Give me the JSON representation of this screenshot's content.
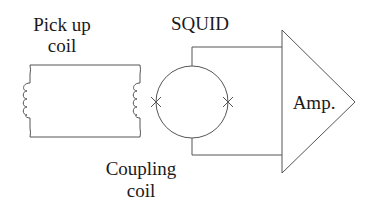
{
  "diagram": {
    "labels": {
      "pickup_line1": "Pick up",
      "pickup_line2": "coil",
      "squid": "SQUID",
      "coupling_line1": "Coupling",
      "coupling_line2": "coil",
      "amp": "Amp."
    },
    "components": [
      {
        "id": "pickup-coil",
        "type": "inductor-loop",
        "label": "Pick up coil"
      },
      {
        "id": "coupling-coil",
        "type": "inductor",
        "label": "Coupling coil"
      },
      {
        "id": "squid-ring",
        "type": "superconducting-loop",
        "label": "SQUID",
        "junctions": 2
      },
      {
        "id": "amplifier",
        "type": "triangle-amplifier",
        "label": "Amp."
      }
    ],
    "connections": [
      {
        "from": "pickup-coil",
        "to": "coupling-coil",
        "kind": "flux-transformer-loop"
      },
      {
        "from": "coupling-coil",
        "to": "squid-ring",
        "kind": "inductive-coupling"
      },
      {
        "from": "squid-ring",
        "to": "amplifier",
        "kind": "wire-top"
      },
      {
        "from": "squid-ring",
        "to": "amplifier",
        "kind": "wire-bottom"
      }
    ],
    "colors": {
      "line": "#555555",
      "text": "#1a1a1a",
      "background": "#ffffff"
    }
  }
}
